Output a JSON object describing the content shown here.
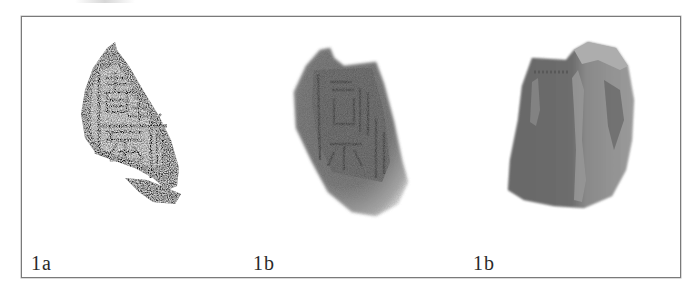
{
  "figure": {
    "panels": [
      {
        "id": "rubbing",
        "label": "1a",
        "description": "ink rubbing of seal impression fragment with seal-script characters"
      },
      {
        "id": "front",
        "label": "1b",
        "description": "photograph of clay sealing fragment, impressed face"
      },
      {
        "id": "back",
        "label": "1b",
        "description": "photograph of clay sealing fragment, reverse side"
      }
    ]
  },
  "colors": {
    "border": "#7a7a7a",
    "label_text": "#2a2a2a",
    "rubbing_ink": "#2b2b2b",
    "clay_dark": "#4a4a4a",
    "clay_light": "#9a9a9a"
  }
}
